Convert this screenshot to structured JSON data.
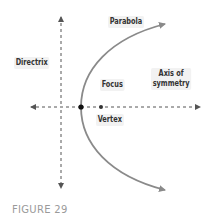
{
  "figure": {
    "caption": "FIGURE 29",
    "labels": {
      "parabola": "Parabola",
      "directrix": "Directrix",
      "focus": "Focus",
      "axis_line1": "Axis of",
      "axis_line2": "symmetry",
      "vertex": "Vertex"
    },
    "colors": {
      "parabola": "#8a8a8a",
      "dashed_lines": "#555555",
      "points": "#222222",
      "label_text": "#333333",
      "caption": "#9a9a9a"
    }
  }
}
